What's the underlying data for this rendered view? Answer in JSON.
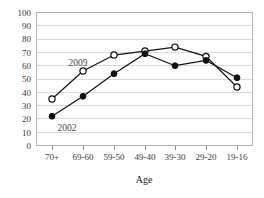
{
  "chart_data": {
    "type": "line",
    "title": "",
    "xlabel": "Age",
    "ylabel": "",
    "categories": [
      "70+",
      "69-60",
      "59-50",
      "49-40",
      "39-30",
      "29-20",
      "19-16"
    ],
    "series": [
      {
        "name": "2009",
        "marker": "open-circle",
        "values": [
          35,
          56,
          68,
          71,
          74,
          67,
          44
        ]
      },
      {
        "name": "2002",
        "marker": "filled-circle",
        "values": [
          22,
          37,
          54,
          69,
          60,
          64,
          51
        ]
      }
    ],
    "ylim": [
      0,
      100
    ],
    "yticks": [
      0,
      10,
      20,
      30,
      40,
      50,
      60,
      70,
      80,
      90,
      100
    ],
    "grid": true,
    "legend": "inline-annotations",
    "annotations": [
      {
        "text": "2009",
        "series": "2009"
      },
      {
        "text": "2002",
        "series": "2002"
      }
    ],
    "colors": {
      "line": "#111111",
      "grid": "#d9d9d9",
      "frame": "#b4b4b4",
      "background": "#ffffff"
    }
  },
  "axis": {
    "y_labels": [
      "100",
      "90",
      "80",
      "70",
      "60",
      "50",
      "40",
      "30",
      "20",
      "10",
      "0"
    ],
    "x_labels": [
      "70+",
      "69-60",
      "59-50",
      "49-40",
      "39-30",
      "29-20",
      "19-16"
    ],
    "x_title": "Age"
  },
  "annotations": {
    "label_2009": "2009",
    "label_2002": "2002"
  }
}
